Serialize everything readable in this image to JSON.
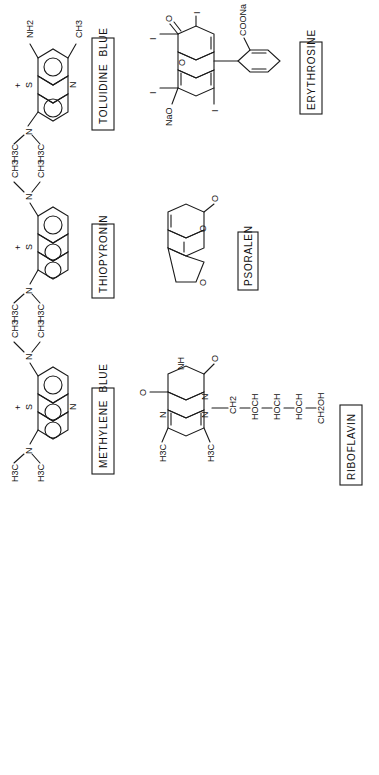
{
  "figure": {
    "orientation": "rotated-90-clockwise",
    "background": "#ffffff",
    "ink": "#1a1a1a",
    "compounds": [
      {
        "id": "toluidine-blue",
        "name": "TOLUIDINE  BLUE",
        "atoms": {
          "charge": "+",
          "ring_s": "S",
          "ring_n": "N",
          "amine": "N",
          "sub1": "NH2",
          "sub2": "CH3",
          "me1": "H3C",
          "me2": "H3C"
        }
      },
      {
        "id": "thiopyronin",
        "name": "THIOPYRONIN",
        "atoms": {
          "charge": "+",
          "ring_s": "S",
          "amine_left": "N",
          "amine_right": "N",
          "me1": "H3C",
          "me2": "H3C",
          "me3": "CH3",
          "me4": "CH3"
        }
      },
      {
        "id": "methylene-blue",
        "name": "METHYLENE  BLUE",
        "atoms": {
          "charge": "+",
          "ring_s": "S",
          "ring_n": "N",
          "amine_left": "N",
          "amine_right": "N",
          "me1": "H3C",
          "me2": "H3C",
          "me3": "CH3",
          "me4": "CH3"
        }
      },
      {
        "id": "erythrosine",
        "name": "ERYTHROSINE",
        "atoms": {
          "oxo": "O",
          "ring_o": "O",
          "iodine": "I",
          "naO": "NaO",
          "coona": "COONa"
        }
      },
      {
        "id": "psoralen",
        "name": "PSORALEN",
        "atoms": {
          "oxo": "O",
          "ring_o1": "O",
          "ring_o2": "O"
        }
      },
      {
        "id": "riboflavin",
        "name": "RIBOFLAVIN",
        "atoms": {
          "oxo1": "O",
          "oxo2": "O",
          "nh": "NH",
          "n1": "N",
          "n2": "N",
          "n3": "N",
          "me1": "H3C",
          "me2": "H3C",
          "chain": [
            "CH2",
            "HOCH",
            "HOCH",
            "HOCH",
            "CH2OH"
          ]
        }
      }
    ]
  }
}
